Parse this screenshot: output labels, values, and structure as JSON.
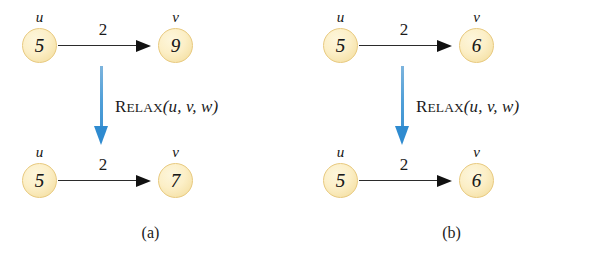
{
  "figure": {
    "relax_label": {
      "name_first": "R",
      "name_rest": "ELAX",
      "args": "(u, v, w)"
    },
    "arrow_color": "#3e93d2",
    "node_fill_color": "#fceec6",
    "node_border_color": "#e8c97e",
    "edge_color": "#2b2b2b"
  },
  "panels": [
    {
      "caption": "(a)",
      "before": {
        "source": {
          "name": "u",
          "value": "5"
        },
        "target": {
          "name": "v",
          "value": "9"
        },
        "weight": "2"
      },
      "after": {
        "source": {
          "name": "u",
          "value": "5"
        },
        "target": {
          "name": "v",
          "value": "7"
        },
        "weight": "2"
      }
    },
    {
      "caption": "(b)",
      "before": {
        "source": {
          "name": "u",
          "value": "5"
        },
        "target": {
          "name": "v",
          "value": "6"
        },
        "weight": "2"
      },
      "after": {
        "source": {
          "name": "u",
          "value": "5"
        },
        "target": {
          "name": "v",
          "value": "6"
        },
        "weight": "2"
      }
    }
  ]
}
